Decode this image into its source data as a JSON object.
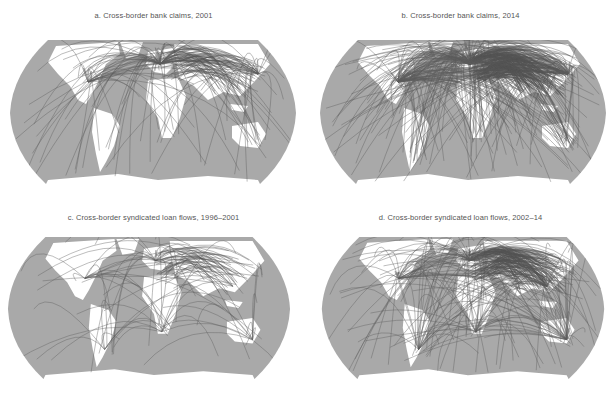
{
  "figure": {
    "header_partial": "",
    "colors": {
      "ocean": "#a9a9a9",
      "land": "#ffffff",
      "flows": "#5f5f5f",
      "title_text": "#555555"
    },
    "panels": [
      {
        "id": "a",
        "title": "a. Cross-border bank claims, 2001",
        "density": "medium",
        "hub": "Europe"
      },
      {
        "id": "b",
        "title": "b. Cross-border bank claims, 2014",
        "density": "very-high",
        "hub": "Europe"
      },
      {
        "id": "c",
        "title": "c. Cross-border syndicated loan flows, 1996–2001",
        "density": "low",
        "hub": "Europe"
      },
      {
        "id": "d",
        "title": "d. Cross-border syndicated loan flows, 2002–14",
        "density": "high",
        "hub": "Europe"
      }
    ]
  }
}
